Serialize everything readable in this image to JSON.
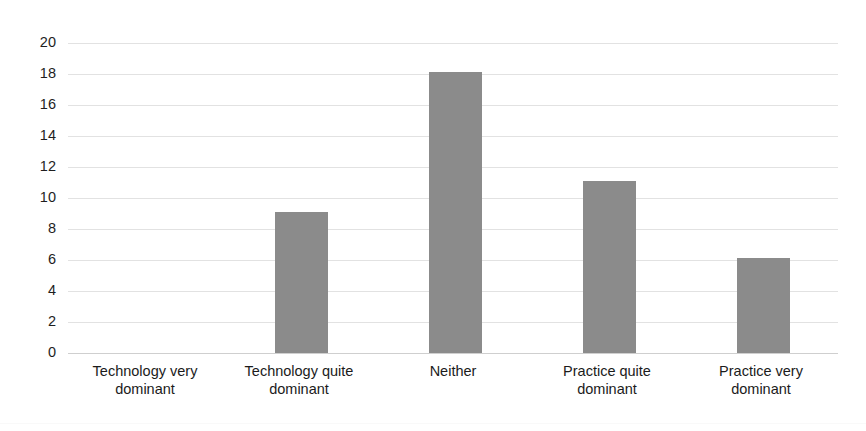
{
  "chart_data": {
    "type": "bar",
    "title": "",
    "xlabel": "",
    "ylabel": "",
    "categories": [
      "Technology very dominant",
      "Technology quite dominant",
      "Neither",
      "Practice quite dominant",
      "Practice very dominant"
    ],
    "values": [
      0,
      9.1,
      18.1,
      11.1,
      6.1
    ],
    "ylim": [
      0,
      20
    ],
    "yticks": [
      20,
      18,
      16,
      14,
      12,
      10,
      8,
      6,
      4,
      2,
      0
    ],
    "ytick_labels": [
      "20",
      "18",
      "16",
      "14",
      "12",
      "10",
      "8",
      "6",
      "4",
      "2",
      "0"
    ],
    "grid": true,
    "legend": false,
    "legend_position": "none",
    "bar_color": "#8b8b8b",
    "grid_color": "#e2e2e2",
    "background_color": "#ffffff",
    "text_color": "#1b1b1b"
  },
  "axis": {
    "y_ticks": [
      {
        "label": "20",
        "value": 20
      },
      {
        "label": "18",
        "value": 18
      },
      {
        "label": "16",
        "value": 16
      },
      {
        "label": "14",
        "value": 14
      },
      {
        "label": "12",
        "value": 12
      },
      {
        "label": "10",
        "value": 10
      },
      {
        "label": "8",
        "value": 8
      },
      {
        "label": "6",
        "value": 6
      },
      {
        "label": "4",
        "value": 4
      },
      {
        "label": "2",
        "value": 2
      },
      {
        "label": "0",
        "value": 0
      }
    ],
    "x_ticks": [
      {
        "line1": "Technology very",
        "line2": "dominant"
      },
      {
        "line1": "Technology quite",
        "line2": "dominant"
      },
      {
        "line1": "Neither",
        "line2": ""
      },
      {
        "line1": "Practice quite",
        "line2": "dominant"
      },
      {
        "line1": "Practice very",
        "line2": "dominant"
      }
    ]
  },
  "bars": [
    {
      "category": "Technology very dominant",
      "value": 0
    },
    {
      "category": "Technology quite dominant",
      "value": 9.1
    },
    {
      "category": "Neither",
      "value": 18.1
    },
    {
      "category": "Practice quite dominant",
      "value": 11.1
    },
    {
      "category": "Practice very dominant",
      "value": 6.1
    }
  ]
}
